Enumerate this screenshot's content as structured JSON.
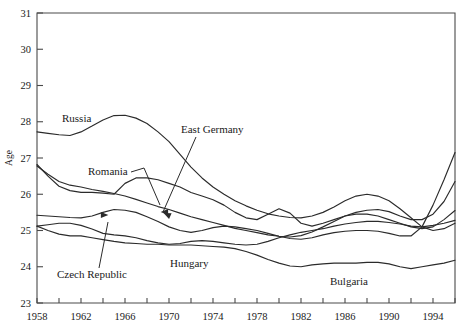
{
  "chart_data": {
    "type": "line",
    "title": "",
    "xlabel": "",
    "ylabel": "Age",
    "xlim": [
      1958,
      1996
    ],
    "ylim": [
      23,
      31
    ],
    "grid": false,
    "legend_position": "inline-annotations",
    "y_ticks": [
      23,
      24,
      25,
      26,
      27,
      28,
      29,
      30,
      31
    ],
    "x_ticks": [
      1958,
      1960,
      1962,
      1964,
      1966,
      1968,
      1970,
      1972,
      1974,
      1976,
      1978,
      1980,
      1982,
      1984,
      1986,
      1988,
      1990,
      1992,
      1994,
      1996
    ],
    "x_tick_labels": [
      "1958",
      "",
      "1962",
      "",
      "1966",
      "",
      "1970",
      "",
      "1974",
      "",
      "1978",
      "",
      "1982",
      "",
      "1986",
      "",
      "1990",
      "",
      "1994",
      ""
    ],
    "series": [
      {
        "name": "Russia",
        "x": [
          1958,
          1959,
          1960,
          1961,
          1962,
          1963,
          1964,
          1965,
          1966,
          1967,
          1968,
          1969,
          1970,
          1971,
          1972,
          1973,
          1974,
          1975,
          1976,
          1977,
          1978,
          1979,
          1980,
          1981,
          1982,
          1983,
          1984,
          1985,
          1986,
          1987,
          1988,
          1989,
          1990,
          1991,
          1992,
          1993,
          1994,
          1995,
          1996
        ],
        "values": [
          27.72,
          27.68,
          27.64,
          27.62,
          27.72,
          27.88,
          28.05,
          28.17,
          28.18,
          28.1,
          27.95,
          27.72,
          27.45,
          27.1,
          26.75,
          26.45,
          26.2,
          26.0,
          25.82,
          25.68,
          25.56,
          25.46,
          25.4,
          25.36,
          25.35,
          25.4,
          25.5,
          25.65,
          25.82,
          25.95,
          26.0,
          25.95,
          25.82,
          25.6,
          25.35,
          25.1,
          25.0,
          25.05,
          25.2
        ]
      },
      {
        "name": "East Germany",
        "x": [
          1958,
          1959,
          1960,
          1961,
          1962,
          1963,
          1964,
          1965,
          1966,
          1967,
          1968,
          1969,
          1970,
          1971,
          1972,
          1973,
          1974,
          1975,
          1976,
          1977,
          1978,
          1979,
          1980,
          1981,
          1982,
          1983,
          1984,
          1985,
          1986,
          1987,
          1988,
          1989,
          1990,
          1991,
          1992,
          1993,
          1994,
          1995,
          1996
        ],
        "values": [
          26.78,
          26.55,
          26.35,
          26.25,
          26.2,
          26.13,
          26.08,
          26.02,
          25.95,
          25.86,
          25.76,
          25.66,
          25.58,
          25.48,
          25.38,
          25.3,
          25.22,
          25.14,
          25.06,
          25.0,
          24.94,
          24.88,
          24.84,
          24.82,
          24.86,
          24.96,
          25.1,
          25.25,
          25.4,
          25.5,
          25.56,
          25.58,
          25.52,
          25.4,
          25.3,
          25.3,
          25.45,
          25.8,
          26.35
        ]
      },
      {
        "name": "Romania",
        "x": [
          1958,
          1959,
          1960,
          1961,
          1962,
          1963,
          1964,
          1965,
          1966,
          1967,
          1968,
          1969,
          1970,
          1971,
          1972,
          1973,
          1974,
          1975,
          1976,
          1977,
          1978,
          1979,
          1980,
          1981,
          1982,
          1983,
          1984,
          1985,
          1986,
          1987,
          1988,
          1989,
          1990,
          1991,
          1992,
          1993,
          1994,
          1995,
          1996
        ],
        "values": [
          26.82,
          26.5,
          26.22,
          26.1,
          26.05,
          26.05,
          26.03,
          26.0,
          26.3,
          26.45,
          26.45,
          26.4,
          26.3,
          26.2,
          26.05,
          25.95,
          25.85,
          25.7,
          25.5,
          25.35,
          25.3,
          25.45,
          25.6,
          25.48,
          25.2,
          25.12,
          25.2,
          25.3,
          25.4,
          25.45,
          25.45,
          25.4,
          25.3,
          25.2,
          25.1,
          25.05,
          25.1,
          25.3,
          25.55
        ]
      },
      {
        "name": "Czech Republic",
        "x": [
          1958,
          1959,
          1960,
          1961,
          1962,
          1963,
          1964,
          1965,
          1966,
          1967,
          1968,
          1969,
          1970,
          1971,
          1972,
          1973,
          1974,
          1975,
          1976,
          1977,
          1978,
          1979,
          1980,
          1981,
          1982,
          1983,
          1984,
          1985,
          1986,
          1987,
          1988,
          1989,
          1990,
          1991,
          1992,
          1993,
          1994,
          1995,
          1996
        ],
        "values": [
          25.42,
          25.4,
          25.38,
          25.36,
          25.35,
          25.4,
          25.5,
          25.58,
          25.56,
          25.5,
          25.38,
          25.25,
          25.1,
          25.0,
          24.95,
          25.0,
          25.08,
          25.12,
          25.1,
          25.05,
          25.0,
          24.92,
          24.84,
          24.78,
          24.76,
          24.8,
          24.88,
          24.94,
          24.98,
          25.0,
          25.0,
          24.98,
          24.92,
          24.85,
          24.85,
          25.1,
          25.7,
          26.4,
          27.15
        ]
      },
      {
        "name": "Hungary",
        "x": [
          1958,
          1959,
          1960,
          1961,
          1962,
          1963,
          1964,
          1965,
          1966,
          1967,
          1968,
          1969,
          1970,
          1971,
          1972,
          1973,
          1974,
          1975,
          1976,
          1977,
          1978,
          1979,
          1980,
          1981,
          1982,
          1983,
          1984,
          1985,
          1986,
          1987,
          1988,
          1989,
          1990,
          1991,
          1992,
          1993,
          1994,
          1995,
          1996
        ],
        "values": [
          25.12,
          25.16,
          25.2,
          25.2,
          25.14,
          25.04,
          24.92,
          24.88,
          24.85,
          24.8,
          24.72,
          24.66,
          24.62,
          24.64,
          24.7,
          24.72,
          24.7,
          24.66,
          24.62,
          24.6,
          24.62,
          24.7,
          24.8,
          24.88,
          24.95,
          25.0,
          25.05,
          25.12,
          25.18,
          25.22,
          25.25,
          25.25,
          25.22,
          25.18,
          25.12,
          25.1,
          25.14,
          25.2,
          25.28
        ]
      },
      {
        "name": "Bulgaria",
        "x": [
          1958,
          1959,
          1960,
          1961,
          1962,
          1963,
          1964,
          1965,
          1966,
          1967,
          1968,
          1969,
          1970,
          1971,
          1972,
          1973,
          1974,
          1975,
          1976,
          1977,
          1978,
          1979,
          1980,
          1981,
          1982,
          1983,
          1984,
          1985,
          1986,
          1987,
          1988,
          1989,
          1990,
          1991,
          1992,
          1993,
          1994,
          1995,
          1996
        ],
        "values": [
          25.12,
          25.0,
          24.9,
          24.85,
          24.85,
          24.8,
          24.75,
          24.7,
          24.66,
          24.64,
          24.62,
          24.62,
          24.6,
          24.6,
          24.6,
          24.58,
          24.56,
          24.54,
          24.5,
          24.42,
          24.32,
          24.2,
          24.1,
          24.02,
          24.0,
          24.05,
          24.08,
          24.1,
          24.1,
          24.1,
          24.12,
          24.12,
          24.08,
          24.0,
          23.95,
          24.0,
          24.05,
          24.1,
          24.18
        ]
      }
    ],
    "annotations": [
      {
        "text": "Russia",
        "x": 62,
        "y": 122,
        "leader": null
      },
      {
        "text": "East Germany",
        "x": 181,
        "y": 133,
        "leader": "east-germany"
      },
      {
        "text": "Romania",
        "x": 88,
        "y": 175,
        "leader": "romania"
      },
      {
        "text": "Czech Republic",
        "x": 57,
        "y": 278,
        "leader": "czech"
      },
      {
        "text": "Hungary",
        "x": 170,
        "y": 267,
        "leader": null
      },
      {
        "text": "Bulgaria",
        "x": 330,
        "y": 285,
        "leader": null
      }
    ]
  }
}
